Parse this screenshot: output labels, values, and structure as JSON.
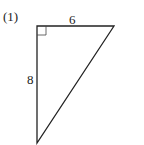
{
  "problem": {
    "number_label": "(1)"
  },
  "triangle": {
    "top_side_label": "6",
    "left_side_label": "8",
    "right_angle": "top-left",
    "vertices": {
      "top_left": [
        37,
        26
      ],
      "top_right": [
        114,
        26
      ],
      "bottom": [
        37,
        143
      ]
    },
    "stroke_color": "#222222"
  }
}
